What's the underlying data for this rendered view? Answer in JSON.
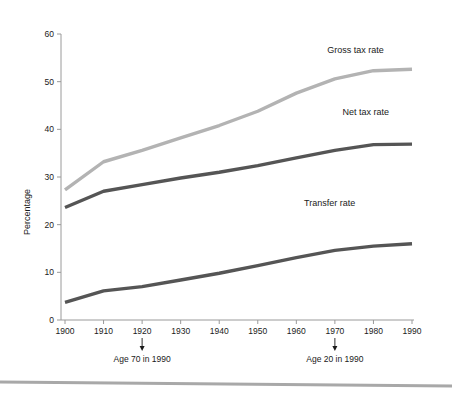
{
  "chart_data": {
    "type": "line",
    "title": "",
    "xlabel": "",
    "ylabel": "Percentage",
    "xlim": [
      1900,
      1990
    ],
    "ylim": [
      0,
      60
    ],
    "grid": false,
    "legend_position": "inline-right",
    "x": [
      1900,
      1910,
      1920,
      1930,
      1940,
      1950,
      1960,
      1970,
      1980,
      1990
    ],
    "xticklabels": [
      "1900",
      "1910",
      "1920",
      "1930",
      "1940",
      "1950",
      "1960",
      "1970",
      "1980",
      "1990"
    ],
    "yticks": [
      0,
      10,
      20,
      30,
      40,
      50,
      60
    ],
    "yticklabels": [
      "0",
      "10",
      "20",
      "30",
      "40",
      "50",
      "60"
    ],
    "series": [
      {
        "name": "Gross tax rate",
        "color": "#b3b3b3",
        "label_x": 1968,
        "label_y": 56,
        "values": [
          27.3,
          33.2,
          35.6,
          38.2,
          40.8,
          43.8,
          47.6,
          50.6,
          52.3,
          52.6
        ]
      },
      {
        "name": "Net tax rate",
        "color": "#555555",
        "label_x": 1972,
        "label_y": 43,
        "values": [
          23.6,
          27.0,
          28.4,
          29.8,
          31.0,
          32.4,
          34.0,
          35.6,
          36.8,
          36.9
        ]
      },
      {
        "name": "Transfer rate",
        "color": "#555555",
        "label_x": 1962,
        "label_y": 24,
        "values": [
          3.7,
          6.1,
          7.0,
          8.4,
          9.8,
          11.4,
          13.1,
          14.6,
          15.5,
          16.0
        ]
      }
    ],
    "annotations": [
      {
        "text": "Age 70 in 1990",
        "x": 1920
      },
      {
        "text": "Age 20 in 1990",
        "x": 1970
      }
    ]
  }
}
